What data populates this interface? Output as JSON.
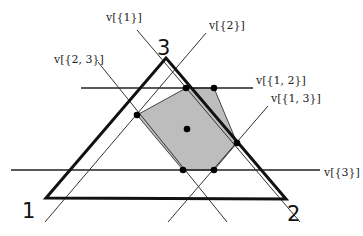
{
  "diagram": {
    "type": "simplex-polytope",
    "vertices": [
      {
        "id": "1",
        "label": "1",
        "x": 46,
        "y": 198,
        "lx": 22,
        "ly": 218
      },
      {
        "id": "2",
        "label": "2",
        "x": 286,
        "y": 199,
        "lx": 287,
        "ly": 221
      },
      {
        "id": "3",
        "label": "3",
        "x": 166,
        "y": 58,
        "lx": 157,
        "ly": 55
      }
    ],
    "lines": [
      {
        "id": "v12",
        "label": "v[{1, 2}]",
        "x1": 81,
        "y1": 88,
        "x2": 253,
        "y2": 88,
        "lx": 256,
        "ly": 84
      },
      {
        "id": "v3",
        "label": "v[{3}]",
        "x1": 11,
        "y1": 170,
        "x2": 320,
        "y2": 170,
        "lx": 324,
        "ly": 176
      },
      {
        "id": "v1",
        "label": "v[{1}]",
        "x1": 137,
        "y1": 30,
        "x2": 300,
        "y2": 222,
        "lx": 106,
        "ly": 21
      },
      {
        "id": "v23",
        "label": "v[{2, 3}]",
        "x1": 98,
        "y1": 62,
        "x2": 227,
        "y2": 222,
        "lx": 54,
        "ly": 63
      },
      {
        "id": "v2",
        "label": "v[{2}]",
        "x1": 206,
        "y1": 33,
        "x2": 45,
        "y2": 222,
        "lx": 209,
        "ly": 29
      },
      {
        "id": "v13",
        "label": "v[{1, 3}]",
        "x1": 268,
        "y1": 106,
        "x2": 168,
        "y2": 222,
        "lx": 271,
        "ly": 102
      }
    ],
    "polygon": {
      "points": "186,88 214,88 237,143 214,170 183,170 137,115",
      "fill": "#bdbdbd",
      "vertices": [
        [
          186,
          88
        ],
        [
          214,
          88
        ],
        [
          237,
          143
        ],
        [
          214,
          170
        ],
        [
          183,
          170
        ],
        [
          137,
          115
        ]
      ]
    },
    "center_point": {
      "x": 187,
      "y": 129
    },
    "colors": {
      "stroke": "#111111",
      "thin": "#333333",
      "fill": "#bdbdbd"
    }
  }
}
